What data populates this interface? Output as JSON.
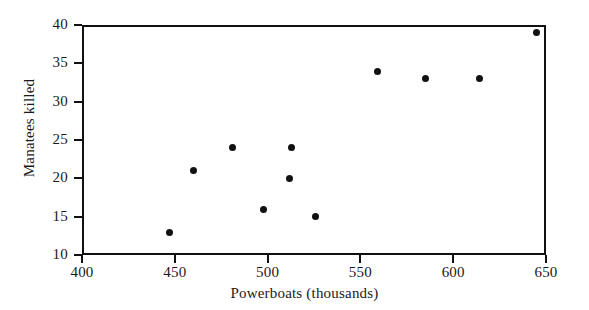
{
  "chart_data": {
    "type": "scatter",
    "title": "",
    "xlabel": "Powerboats (thousands)",
    "ylabel": "Manatees killed",
    "xlim": [
      400,
      650
    ],
    "ylim": [
      10,
      40
    ],
    "xticks": [
      400,
      450,
      500,
      550,
      600,
      650
    ],
    "yticks": [
      10,
      15,
      20,
      25,
      30,
      35,
      40
    ],
    "grid": false,
    "legend": false,
    "marker": "filled-circle",
    "marker_color": "#111111",
    "points": [
      {
        "x": 447,
        "y": 13
      },
      {
        "x": 460,
        "y": 21
      },
      {
        "x": 481,
        "y": 24
      },
      {
        "x": 498,
        "y": 16
      },
      {
        "x": 512,
        "y": 20
      },
      {
        "x": 513,
        "y": 24
      },
      {
        "x": 526,
        "y": 15
      },
      {
        "x": 559,
        "y": 34
      },
      {
        "x": 585,
        "y": 33
      },
      {
        "x": 614,
        "y": 33
      },
      {
        "x": 645,
        "y": 39
      }
    ]
  },
  "colors": {
    "axis": "#111111",
    "marker": "#111111",
    "background": "#ffffff"
  }
}
